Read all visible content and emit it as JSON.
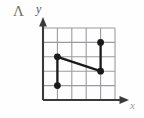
{
  "figure": {
    "corner_mark": "Λ",
    "axis_labels": {
      "y": "y",
      "x": "x"
    },
    "colors": {
      "grid": "#9a9aa2",
      "axis": "#3a3a3a",
      "data": "#1a1a1a",
      "background": "#fefefe",
      "mark": "#6e6e6e"
    }
  },
  "chart_data": {
    "type": "line",
    "title": "",
    "xlabel": "x",
    "ylabel": "y",
    "grid": true,
    "legend": "none",
    "xlim": [
      0,
      5
    ],
    "ylim": [
      0,
      5
    ],
    "xticks": [
      0,
      1,
      2,
      3,
      4,
      5
    ],
    "yticks": [
      0,
      1,
      2,
      3,
      4,
      5
    ],
    "xtick_labels": [
      "",
      "",
      "",
      "",
      "",
      ""
    ],
    "ytick_labels": [
      "",
      "",
      "",
      "",
      "",
      ""
    ],
    "points": [
      {
        "x": 1,
        "y": 1
      },
      {
        "x": 1,
        "y": 3
      },
      {
        "x": 4,
        "y": 2
      },
      {
        "x": 4,
        "y": 4
      }
    ],
    "segments": [
      {
        "x1": 1,
        "y1": 1,
        "x2": 1,
        "y2": 3
      },
      {
        "x1": 1,
        "y1": 3,
        "x2": 4,
        "y2": 2
      },
      {
        "x1": 4,
        "y1": 2,
        "x2": 4,
        "y2": 4
      }
    ],
    "series": [
      {
        "name": "path",
        "x": [
          1,
          1,
          4,
          4
        ],
        "values": [
          1,
          3,
          2,
          4
        ]
      }
    ]
  }
}
